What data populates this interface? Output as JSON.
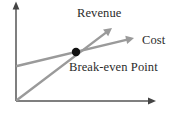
{
  "figure": {
    "background_color": "#ffffff",
    "axis_color": "#555555",
    "line_color": "#9a9a9a",
    "point_color": "#111111",
    "text_color": "#2b2b2b"
  },
  "labels": {
    "revenue": "Revenue",
    "cost": "Cost",
    "break_even": "Break-even Point"
  },
  "chart_data": {
    "type": "line",
    "title": "",
    "xlabel": "",
    "ylabel": "",
    "xlim": [
      0,
      155
    ],
    "ylim": [
      0,
      101
    ],
    "grid": false,
    "legend": "inline-annotations",
    "annotations": [
      {
        "name": "revenue-label",
        "text": "Revenue",
        "x": 77,
        "y": 14
      },
      {
        "name": "cost-label",
        "text": "Cost",
        "x": 142,
        "y": 41
      },
      {
        "name": "break-even-label",
        "text": "Break-even Point",
        "x": 69,
        "y": 68
      }
    ],
    "axes": {
      "origin": {
        "x": 16,
        "y": 101
      },
      "y_axis_tip": {
        "x": 16,
        "y": 2
      },
      "x_axis_tip": {
        "x": 156,
        "y": 101
      },
      "arrowheads": true
    },
    "series": [
      {
        "name": "Revenue",
        "color": "#9a9a9a",
        "arrow_end": true,
        "points": [
          {
            "x": 17,
            "y": 100
          },
          {
            "x": 112,
            "y": 28
          }
        ]
      },
      {
        "name": "Cost",
        "color": "#9a9a9a",
        "arrow_end": true,
        "points": [
          {
            "x": 17,
            "y": 66
          },
          {
            "x": 134,
            "y": 38
          }
        ]
      }
    ],
    "markers": [
      {
        "name": "Break-even Point",
        "x": 76,
        "y": 52,
        "radius": 4.2,
        "color": "#111111"
      }
    ]
  }
}
